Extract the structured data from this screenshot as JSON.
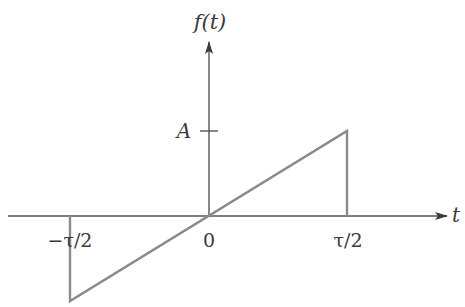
{
  "figure": {
    "y_axis_label": "f(t)",
    "x_axis_label": "t",
    "amplitude_label": "A",
    "x_ticks": {
      "neg": "−τ/2",
      "zero": "0",
      "pos": "τ/2"
    }
  },
  "colors": {
    "axis": "#555555",
    "signal": "#8a8a8a",
    "text": "#3a3a3a"
  },
  "signal": {
    "description": "Sawtooth pulse: f(t) = (2A/τ) t for -τ/2 < t < τ/2, 0 otherwise",
    "points": [
      {
        "t": "-τ/2",
        "f": 0
      },
      {
        "t": "-τ/2",
        "f": "-A"
      },
      {
        "t": "τ/2",
        "f": "A"
      },
      {
        "t": "τ/2",
        "f": 0
      }
    ]
  }
}
